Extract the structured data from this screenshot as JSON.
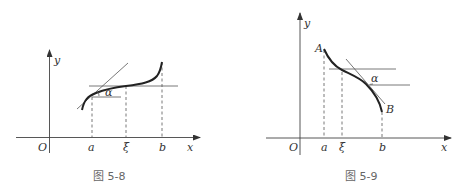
{
  "figures": [
    {
      "id": "fig-5-8",
      "caption": "图 5-8",
      "labels": {
        "origin": "O",
        "x_axis": "x",
        "y_axis": "y",
        "a": "a",
        "xi": "ξ",
        "b": "b",
        "alpha": "α"
      }
    },
    {
      "id": "fig-5-9",
      "caption": "图 5-9",
      "labels": {
        "origin": "O",
        "x_axis": "x",
        "y_axis": "y",
        "a": "a",
        "xi": "ξ",
        "b": "b",
        "alpha": "α",
        "point_A": "A",
        "point_B": "B"
      }
    }
  ]
}
